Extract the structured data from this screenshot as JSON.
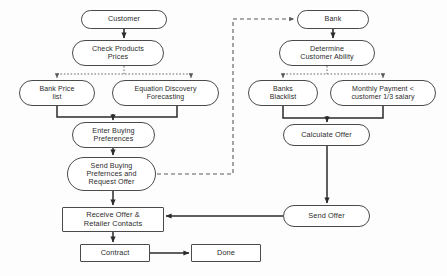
{
  "diagram": {
    "type": "flowchart",
    "stroke_color": "#4a4a4a",
    "text_color": "#2b2b2b",
    "background_color": "#fdfdfd",
    "nodes": [
      {
        "id": "customer",
        "label": "Customer",
        "shape": "oval",
        "x": 81,
        "y": 10,
        "w": 86,
        "h": 19,
        "font": 7.2
      },
      {
        "id": "check-products",
        "label": "Check Products\nPrices",
        "shape": "oval",
        "x": 72,
        "y": 40,
        "w": 92,
        "h": 26,
        "font": 7.2
      },
      {
        "id": "bank-price-list",
        "label": "Bank Price\nlist",
        "shape": "oval",
        "x": 19,
        "y": 80,
        "w": 76,
        "h": 26,
        "font": 7.0
      },
      {
        "id": "equation-discovery",
        "label": "Equation Discovery\nForecasting",
        "shape": "oval",
        "x": 112,
        "y": 80,
        "w": 107,
        "h": 26,
        "font": 7.0
      },
      {
        "id": "enter-buying",
        "label": "Enter Buying\nPreferences",
        "shape": "oval",
        "x": 72,
        "y": 122,
        "w": 83,
        "h": 26,
        "font": 7.2
      },
      {
        "id": "send-buying",
        "label": "Send Buying\nPrefernces and\nRequest Offer",
        "shape": "oval",
        "x": 67,
        "y": 157,
        "w": 89,
        "h": 34,
        "font": 7.2
      },
      {
        "id": "receive-offer",
        "label": "Receive Offer &\nRetailer Contacts",
        "shape": "rect",
        "x": 62,
        "y": 207,
        "w": 102,
        "h": 25,
        "font": 7.4
      },
      {
        "id": "contract",
        "label": "Contract",
        "shape": "rect",
        "x": 80,
        "y": 244,
        "w": 70,
        "h": 18,
        "font": 7.4
      },
      {
        "id": "done",
        "label": "Done",
        "shape": "rect",
        "x": 191,
        "y": 244,
        "w": 70,
        "h": 18,
        "font": 7.4
      },
      {
        "id": "bank",
        "label": "Bank",
        "shape": "oval",
        "x": 297,
        "y": 10,
        "w": 72,
        "h": 19,
        "font": 7.2
      },
      {
        "id": "determine-ability",
        "label": "Determine\nCustomer Ability",
        "shape": "oval",
        "x": 279,
        "y": 40,
        "w": 96,
        "h": 26,
        "font": 7.2
      },
      {
        "id": "banks-blacklist",
        "label": "Banks\nBlacklist",
        "shape": "oval",
        "x": 248,
        "y": 80,
        "w": 70,
        "h": 26,
        "font": 7.0
      },
      {
        "id": "monthly-payment",
        "label": "Monthly Payment <\ncustomer 1/3 salary",
        "shape": "oval",
        "x": 330,
        "y": 80,
        "w": 106,
        "h": 26,
        "font": 7.0
      },
      {
        "id": "calculate-offer",
        "label": "Calculate Offer",
        "shape": "oval",
        "x": 283,
        "y": 124,
        "w": 87,
        "h": 22,
        "font": 7.4
      },
      {
        "id": "send-offer",
        "label": "Send Offer",
        "shape": "oval",
        "x": 283,
        "y": 205,
        "w": 87,
        "h": 22,
        "font": 7.4
      }
    ],
    "edges": [
      {
        "id": "customer-to-check",
        "from": "customer",
        "to": "check-products",
        "style": "solid",
        "arrow": true
      },
      {
        "id": "check-to-fanout",
        "from": "check-products",
        "to": "fan-bus-left",
        "style": "dotted",
        "arrow": false
      },
      {
        "id": "fanout-to-bank-price-list",
        "from": "fan-bus-left",
        "to": "bank-price-list",
        "style": "dotted",
        "arrow": true
      },
      {
        "id": "fanout-to-equation-discovery",
        "from": "fan-bus-left",
        "to": "equation-discovery",
        "style": "dotted",
        "arrow": true
      },
      {
        "id": "bank-price-list-to-enter",
        "from": "bank-price-list",
        "to": "enter-buying",
        "style": "solid",
        "arrow": true
      },
      {
        "id": "equation-to-enter",
        "from": "equation-discovery",
        "to": "enter-buying",
        "style": "solid",
        "arrow": true
      },
      {
        "id": "enter-to-send-buying",
        "from": "enter-buying",
        "to": "send-buying",
        "style": "solid",
        "arrow": true
      },
      {
        "id": "send-buying-to-bank",
        "from": "send-buying",
        "to": "bank",
        "style": "dashed",
        "arrow": true
      },
      {
        "id": "send-buying-to-receive",
        "from": "send-buying",
        "to": "receive-offer",
        "style": "solid",
        "arrow": true
      },
      {
        "id": "receive-to-contract",
        "from": "receive-offer",
        "to": "contract",
        "style": "solid",
        "arrow": true
      },
      {
        "id": "contract-to-done",
        "from": "contract",
        "to": "done",
        "style": "solid",
        "arrow": true
      },
      {
        "id": "bank-to-determine",
        "from": "bank",
        "to": "determine-ability",
        "style": "solid",
        "arrow": true
      },
      {
        "id": "determine-to-fanout",
        "from": "determine-ability",
        "to": "fan-bus-right",
        "style": "dotted",
        "arrow": false
      },
      {
        "id": "fanout-to-banks-blacklist",
        "from": "fan-bus-right",
        "to": "banks-blacklist",
        "style": "dotted",
        "arrow": true
      },
      {
        "id": "fanout-to-monthly-payment",
        "from": "fan-bus-right",
        "to": "monthly-payment",
        "style": "dotted",
        "arrow": true
      },
      {
        "id": "blacklist-to-calculate",
        "from": "banks-blacklist",
        "to": "calculate-offer",
        "style": "solid",
        "arrow": true
      },
      {
        "id": "monthly-to-calculate",
        "from": "monthly-payment",
        "to": "calculate-offer",
        "style": "solid",
        "arrow": true
      },
      {
        "id": "calculate-to-send-offer",
        "from": "calculate-offer",
        "to": "send-offer",
        "style": "solid",
        "arrow": true
      },
      {
        "id": "send-offer-to-receive",
        "from": "send-offer",
        "to": "receive-offer",
        "style": "solid",
        "arrow": true
      }
    ]
  }
}
